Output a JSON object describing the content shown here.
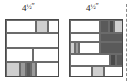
{
  "figure": {
    "type": "quilt-block-diagram",
    "background": "#ffffff"
  },
  "palette": {
    "white": "#ffffff",
    "light_gray": "#cfcfcf",
    "medium_gray": "#9a9a9a",
    "dark_gray": "#5a5a5a",
    "very_dark_gray": "#4a4a4a",
    "outline": "#4a4a4a",
    "seam": "#6b6b6b",
    "dashed_line": "#8a8a8a",
    "text": "#1a1a1a"
  },
  "labels": {
    "left_block_size": {
      "number": "4",
      "fraction": "1/2",
      "unit": "″",
      "full": "4½″"
    },
    "right_block_size": {
      "number": "4",
      "fraction": "1/2",
      "unit": "″",
      "full": "4½″"
    }
  },
  "left_block": {
    "name": "left-quilt-block",
    "x": 5,
    "y": 19,
    "width": 54,
    "height": 58,
    "rows": [
      {
        "name": "row-1",
        "top": 0,
        "height": 13,
        "patches": [
          {
            "name": "patch-white",
            "left": 0,
            "width": 30,
            "fill": "white"
          },
          {
            "name": "patch-light",
            "left": 30,
            "width": 12,
            "fill": "light_gray"
          },
          {
            "name": "patch-white-2",
            "left": 42,
            "width": 12,
            "fill": "white"
          }
        ]
      },
      {
        "name": "row-2",
        "top": 13,
        "height": 15,
        "patches": [
          {
            "name": "patch-white-wide",
            "left": 0,
            "width": 54,
            "fill": "white"
          }
        ]
      },
      {
        "name": "row-3",
        "top": 28,
        "height": 14,
        "patches": [
          {
            "name": "patch-white-a",
            "left": 0,
            "width": 27,
            "fill": "white"
          },
          {
            "name": "patch-white-b",
            "left": 27,
            "width": 27,
            "fill": "white"
          }
        ]
      },
      {
        "name": "row-4",
        "top": 42,
        "height": 16,
        "patches": [
          {
            "name": "patch-light",
            "left": 0,
            "width": 14,
            "fill": "light_gray"
          },
          {
            "name": "patch-medium",
            "left": 14,
            "width": 6,
            "fill": "medium_gray"
          },
          {
            "name": "patch-dark",
            "left": 20,
            "width": 5,
            "fill": "dark_gray"
          },
          {
            "name": "patch-medium-2",
            "left": 25,
            "width": 5,
            "fill": "medium_gray"
          },
          {
            "name": "patch-white",
            "left": 30,
            "width": 24,
            "fill": "white"
          }
        ]
      }
    ]
  },
  "right_block": {
    "name": "right-quilt-block",
    "x": 69,
    "y": 19,
    "width": 54,
    "height": 58,
    "rows": [
      {
        "name": "row-1",
        "top": 0,
        "height": 13,
        "patches": [
          {
            "name": "patch-white",
            "left": 0,
            "width": 30,
            "fill": "white"
          },
          {
            "name": "patch-dark",
            "left": 30,
            "width": 9,
            "fill": "dark_gray"
          },
          {
            "name": "patch-very-dark",
            "left": 39,
            "width": 5,
            "fill": "very_dark_gray"
          },
          {
            "name": "patch-light",
            "left": 44,
            "width": 10,
            "fill": "light_gray"
          }
        ]
      },
      {
        "name": "row-2",
        "top": 13,
        "height": 9,
        "patches": [
          {
            "name": "patch-white",
            "left": 0,
            "width": 30,
            "fill": "white"
          },
          {
            "name": "patch-dark",
            "left": 30,
            "width": 24,
            "fill": "dark_gray"
          }
        ]
      },
      {
        "name": "row-3",
        "top": 22,
        "height": 12,
        "patches": [
          {
            "name": "patch-light",
            "left": 0,
            "width": 5,
            "fill": "light_gray"
          },
          {
            "name": "patch-medium",
            "left": 5,
            "width": 4,
            "fill": "medium_gray"
          },
          {
            "name": "patch-white",
            "left": 9,
            "width": 21,
            "fill": "white"
          },
          {
            "name": "patch-dark",
            "left": 30,
            "width": 24,
            "fill": "dark_gray"
          }
        ]
      },
      {
        "name": "row-4",
        "top": 34,
        "height": 12,
        "patches": [
          {
            "name": "patch-white-wide",
            "left": 0,
            "width": 40,
            "fill": "white"
          },
          {
            "name": "patch-very-dark",
            "left": 40,
            "width": 6,
            "fill": "very_dark_gray"
          },
          {
            "name": "patch-dark",
            "left": 46,
            "width": 8,
            "fill": "dark_gray"
          }
        ]
      },
      {
        "name": "row-5",
        "top": 46,
        "height": 12,
        "patches": [
          {
            "name": "patch-white",
            "left": 0,
            "width": 22,
            "fill": "white"
          },
          {
            "name": "patch-light",
            "left": 22,
            "width": 12,
            "fill": "light_gray"
          },
          {
            "name": "patch-white-2",
            "left": 34,
            "width": 20,
            "fill": "white"
          }
        ]
      }
    ]
  },
  "cut_line": {
    "name": "cutting-guide-dashed-line",
    "x": 126,
    "y_top": 4,
    "y_bottom": 81
  }
}
